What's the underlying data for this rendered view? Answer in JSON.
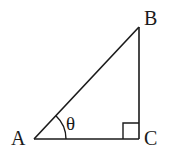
{
  "diagram": {
    "type": "right-triangle",
    "stroke_color": "#1a1a1a",
    "vertices": [
      {
        "label": "A",
        "role": "acute-angle vertex with marked angle"
      },
      {
        "label": "B",
        "role": "top vertex"
      },
      {
        "label": "C",
        "role": "right-angle vertex"
      }
    ],
    "angle_label": "θ",
    "right_angle_marker_at": "C"
  }
}
